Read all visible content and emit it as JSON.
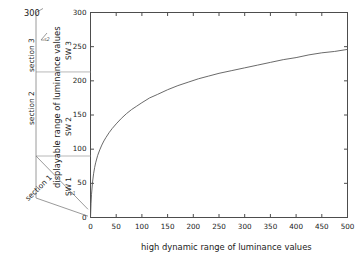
{
  "figure": {
    "background_color": "#ffffff",
    "axis_color": "#4d4d4d",
    "curve_color": "#595959",
    "divider_color": "#a6a6a6",
    "bracket_color": "#808080"
  },
  "top_left_label": "300",
  "axes": {
    "x_title": "high dynamic range of luminance values",
    "y_title": "displayable range of luminance values",
    "x_ticks": [
      "0",
      "50",
      "100",
      "150",
      "200",
      "250",
      "300",
      "350",
      "400",
      "450",
      "500"
    ],
    "y_ticks": [
      "0",
      "50",
      "100",
      "150",
      "200",
      "250",
      "300"
    ]
  },
  "sw_labels": [
    {
      "id": "sw1",
      "text": "SW 1"
    },
    {
      "id": "sw2",
      "text": "SW 2"
    },
    {
      "id": "sw3",
      "text": "SW 3"
    }
  ],
  "section_labels": [
    {
      "id": "section1",
      "text": "section 1"
    },
    {
      "id": "section2",
      "text": "section 2"
    },
    {
      "id": "section3",
      "text": "section 3"
    }
  ],
  "marker_labels": [
    {
      "id": "marker_upper",
      "text": "s2"
    },
    {
      "id": "marker_lower",
      "text": "s1"
    }
  ],
  "chart_data": {
    "type": "line",
    "title": "",
    "xlabel": "high dynamic range of luminance values",
    "ylabel": "displayable range of luminance values",
    "xlim": [
      0,
      500
    ],
    "ylim": [
      0,
      300
    ],
    "xticks": [
      0,
      50,
      100,
      150,
      200,
      250,
      300,
      350,
      400,
      450,
      500
    ],
    "yticks": [
      0,
      50,
      100,
      150,
      200,
      250,
      300
    ],
    "grid": false,
    "legend": null,
    "series": [
      {
        "name": "tone mapping curve",
        "x": [
          0,
          1,
          2,
          4,
          6,
          8,
          10,
          14,
          18,
          22,
          26,
          30,
          36,
          42,
          50,
          60,
          70,
          80,
          90,
          100,
          115,
          130,
          150,
          170,
          190,
          210,
          230,
          250,
          275,
          300,
          325,
          350,
          375,
          400,
          425,
          450,
          475,
          500
        ],
        "y": [
          0,
          20,
          34,
          52,
          64,
          73,
          80,
          91,
          99,
          106,
          112,
          117,
          124,
          130,
          137,
          145,
          152,
          158,
          163,
          168,
          175,
          180,
          187,
          193,
          198,
          203,
          207,
          211,
          215,
          219,
          223,
          227,
          231,
          234,
          238,
          241,
          243,
          246
        ]
      }
    ],
    "annotations": [
      {
        "type": "hline",
        "y": 90,
        "label": "SW1/SW2 boundary"
      },
      {
        "type": "hline",
        "y": 213,
        "label": "SW2/SW3 boundary"
      },
      {
        "type": "region",
        "label": "SW 1",
        "y_range": [
          0,
          90
        ]
      },
      {
        "type": "region",
        "label": "SW 2",
        "y_range": [
          90,
          213
        ]
      },
      {
        "type": "region",
        "label": "SW 3",
        "y_range": [
          213,
          300
        ]
      },
      {
        "type": "bracket",
        "label": "section 1",
        "y_range": [
          0,
          90
        ]
      },
      {
        "type": "bracket",
        "label": "section 2",
        "y_range": [
          90,
          213
        ]
      },
      {
        "type": "bracket",
        "label": "section 3",
        "y_range": [
          213,
          300
        ]
      }
    ]
  }
}
